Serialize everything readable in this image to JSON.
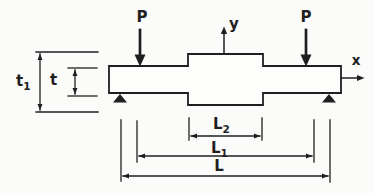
{
  "colors": {
    "line": "#1f1f1f",
    "background": "#fbfbf9",
    "beam_fill": "#fdfdfc"
  },
  "loads": {
    "left": "P",
    "right": "P"
  },
  "axes": {
    "y": "y",
    "x": "x"
  },
  "dims": {
    "t1": {
      "base": "t",
      "sub": "1"
    },
    "t": {
      "base": "t"
    },
    "L2": {
      "base": "L",
      "sub": "2"
    },
    "L1": {
      "base": "L",
      "sub": "1"
    },
    "L": {
      "base": "L"
    }
  }
}
